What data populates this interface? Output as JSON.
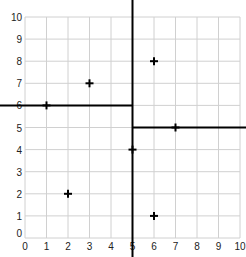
{
  "chart_data": {
    "type": "scatter",
    "title": "",
    "xlabel": "",
    "ylabel": "",
    "xlim": [
      0,
      10
    ],
    "ylim": [
      0,
      10
    ],
    "grid": true,
    "x_ticks": [
      "0",
      "1",
      "2",
      "3",
      "4",
      "5",
      "6",
      "7",
      "8",
      "9",
      "10"
    ],
    "y_ticks": [
      "0",
      "1",
      "2",
      "3",
      "4",
      "5",
      "6",
      "7",
      "8",
      "9",
      "10"
    ],
    "points": [
      {
        "x": 1,
        "y": 6
      },
      {
        "x": 3,
        "y": 7
      },
      {
        "x": 6,
        "y": 8
      },
      {
        "x": 2,
        "y": 2
      },
      {
        "x": 6,
        "y": 1
      },
      {
        "x": 5,
        "y": 4
      },
      {
        "x": 7,
        "y": 5
      }
    ],
    "split_lines": [
      {
        "orientation": "vertical",
        "x": 5,
        "y_from": "top",
        "y_to": "bottom"
      },
      {
        "orientation": "horizontal",
        "y": 6,
        "x_from": "left",
        "x_to": 5
      },
      {
        "orientation": "horizontal",
        "y": 5,
        "x_from": 5,
        "x_to": "right"
      }
    ],
    "marker": "plus",
    "colors": {
      "grid": "#d0d0d0",
      "marker": "#000000",
      "split_line": "#000000"
    }
  }
}
